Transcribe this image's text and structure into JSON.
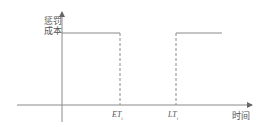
{
  "diagram": {
    "y_axis_label_line1": "惩罚",
    "y_axis_label_line2": "成本",
    "x_axis_label": "时间",
    "ticks": [
      {
        "main": "ET",
        "sub": "i"
      },
      {
        "main": "LT",
        "sub": "i"
      }
    ],
    "colors": {
      "line": "#8a8a8a",
      "text": "#555555"
    }
  }
}
